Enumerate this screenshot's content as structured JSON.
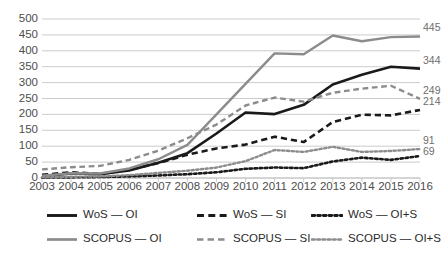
{
  "chart_data": {
    "type": "line",
    "title": "",
    "subtitle": "",
    "xlabel": "",
    "ylabel": "",
    "categories": [
      "2003",
      "2004",
      "2005",
      "2006",
      "2007",
      "2008",
      "2009",
      "2010",
      "2011",
      "2012",
      "2013",
      "2014",
      "2015",
      "2016"
    ],
    "x": [
      2003,
      2004,
      2005,
      2006,
      2007,
      2008,
      2009,
      2010,
      2011,
      2012,
      2013,
      2014,
      2015,
      2016
    ],
    "ylim": [
      0,
      500
    ],
    "ytick_values": [
      0,
      50,
      100,
      150,
      200,
      250,
      300,
      350,
      400,
      450,
      500
    ],
    "ytick_labels": [
      "0",
      "50",
      "100",
      "150",
      "200",
      "250",
      "300",
      "350",
      "400",
      "450",
      "500"
    ],
    "grid": true,
    "grid_axis": "y",
    "legend_position": "bottom",
    "legend_columns": 3,
    "series": [
      {
        "name": "WoS — OI",
        "style": "solid",
        "color": "#1a1a1a",
        "width": 2.6,
        "values": [
          6,
          14,
          12,
          24,
          48,
          78,
          140,
          206,
          201,
          230,
          294,
          325,
          350,
          344
        ],
        "end_label": "344"
      },
      {
        "name": "WoS — SI",
        "style": "dashed",
        "color": "#1a1a1a",
        "width": 2.6,
        "values": [
          10,
          18,
          13,
          26,
          47,
          73,
          93,
          105,
          130,
          113,
          176,
          199,
          197,
          214
        ],
        "end_label": "214"
      },
      {
        "name": "WoS — OI+S",
        "style": "dotted",
        "color": "#1a1a1a",
        "width": 2.6,
        "values": [
          1,
          2,
          3,
          5,
          8,
          12,
          18,
          29,
          33,
          31,
          52,
          64,
          57,
          69
        ],
        "end_label": "69"
      },
      {
        "name": "SCOPUS — OI",
        "style": "solid",
        "color": "#8c8c8c",
        "width": 2.4,
        "values": [
          7,
          15,
          14,
          30,
          59,
          104,
          200,
          296,
          392,
          389,
          448,
          430,
          443,
          445
        ],
        "end_label": "445"
      },
      {
        "name": "SCOPUS — SI",
        "style": "dashed",
        "color": "#8c8c8c",
        "width": 2.4,
        "values": [
          27,
          34,
          38,
          57,
          86,
          125,
          168,
          228,
          253,
          240,
          268,
          281,
          290,
          249
        ],
        "end_label": "249"
      },
      {
        "name": "SCOPUS — OI+S",
        "style": "dotted",
        "color": "#8c8c8c",
        "width": 2.4,
        "values": [
          2,
          4,
          5,
          9,
          16,
          23,
          33,
          53,
          88,
          82,
          98,
          82,
          85,
          91
        ],
        "end_label": "91"
      }
    ]
  },
  "legend": {
    "items": [
      {
        "label": "WoS — OI"
      },
      {
        "label": "WoS — SI"
      },
      {
        "label": "WoS — OI+S"
      },
      {
        "label": "SCOPUS — OI"
      },
      {
        "label": "SCOPUS — SI"
      },
      {
        "label": "SCOPUS — OI+S"
      }
    ]
  }
}
